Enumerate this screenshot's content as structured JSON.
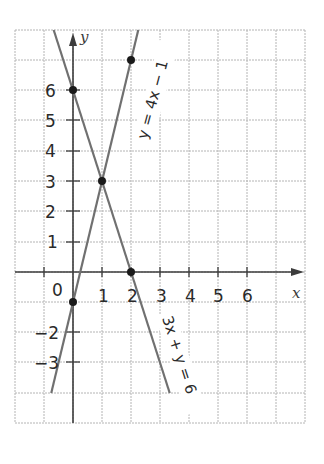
{
  "chart_data": {
    "type": "line",
    "title": "",
    "xlabel": "x",
    "ylabel": "y",
    "xlim": [
      -2,
      8
    ],
    "ylim": [
      -5,
      8
    ],
    "grid": true,
    "x_ticks": [
      0,
      1,
      2,
      3,
      4,
      5,
      6
    ],
    "x_tick_labels": [
      "0",
      "1",
      "2",
      "3",
      "4",
      "5",
      "6"
    ],
    "y_ticks": [
      -3,
      -2,
      1,
      2,
      3,
      4,
      5,
      6
    ],
    "y_tick_labels": [
      "-3",
      "-2",
      "1",
      "2",
      "3",
      "4",
      "5",
      "6"
    ],
    "origin_label": "0",
    "series": [
      {
        "name": "y = 4x − 1",
        "equation": "y = 4x − 1",
        "x": [
          -0.75,
          2.25
        ],
        "y": [
          -4,
          8
        ],
        "marked_points": [
          [
            0,
            -1
          ],
          [
            1,
            3
          ],
          [
            2,
            7
          ]
        ],
        "color": "#6e6e6e"
      },
      {
        "name": "3x + y = 6",
        "equation": "3x + y = 6",
        "x": [
          -0.667,
          3.333
        ],
        "y": [
          8,
          -4
        ],
        "marked_points": [
          [
            0,
            6
          ],
          [
            1,
            3
          ],
          [
            2,
            0
          ]
        ],
        "color": "#6e6e6e"
      }
    ],
    "intersection": [
      1,
      3
    ]
  },
  "labels": {
    "x_axis": "x",
    "y_axis": "y",
    "origin": "0",
    "line1": "y = 4x − 1",
    "line2": "3x + y = 6",
    "xt": [
      "1",
      "2",
      "3",
      "4",
      "5",
      "6"
    ],
    "yt_pos": [
      "1",
      "2",
      "3",
      "4",
      "5",
      "6"
    ],
    "yt_neg": [
      "−2",
      "−3"
    ]
  }
}
